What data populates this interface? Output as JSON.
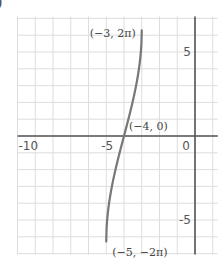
{
  "corner_label": ")",
  "chart_data": {
    "type": "line",
    "title": "",
    "xlabel": "",
    "ylabel": "",
    "xlim": [
      -10,
      1
    ],
    "ylim": [
      -7,
      7
    ],
    "grid": true,
    "grid_step": 1,
    "x_ticks": [
      {
        "value": -10,
        "label": "-10"
      },
      {
        "value": -5,
        "label": "-5"
      },
      {
        "value": 0,
        "label": "0"
      }
    ],
    "y_ticks": [
      {
        "value": 5,
        "label": "5"
      },
      {
        "value": -5,
        "label": "-5"
      }
    ],
    "series": [
      {
        "name": "y = 4·arcsin(x+4)",
        "color": "#777777",
        "x": [
          -5,
          -4.9,
          -4.75,
          -4.5,
          -4.25,
          -4,
          -3.75,
          -3.5,
          -3.25,
          -3.1,
          -3
        ],
        "y": [
          -6.283,
          -4.512,
          -3.393,
          -2.094,
          -1.011,
          0,
          1.011,
          2.094,
          3.393,
          4.512,
          6.283
        ]
      }
    ],
    "annotations": [
      {
        "x": -3,
        "y": 6.283,
        "label": "(−3, 2π)"
      },
      {
        "x": -4,
        "y": 0,
        "label": "(−4, 0)"
      },
      {
        "x": -5,
        "y": -6.283,
        "label": "(−5, −2π)"
      }
    ]
  }
}
